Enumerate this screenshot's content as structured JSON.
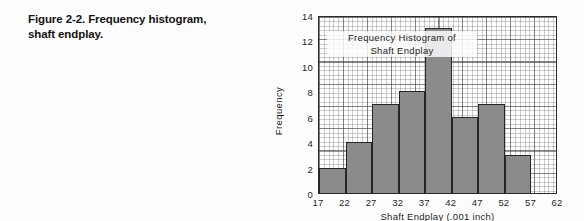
{
  "caption": {
    "line1": "Figure 2-2. Frequency histogram,",
    "line2": "shaft endplay."
  },
  "chart_data": {
    "type": "bar",
    "title": "Frequency Histogram of Shaft Endplay",
    "title_line1": "Frequency Histogram of",
    "title_line2": "Shaft Endplay",
    "xlabel": "Shaft Endplay (.001 inch)",
    "ylabel": "Frequency",
    "categories": [
      "17-22",
      "22-27",
      "27-32",
      "32-37",
      "37-42",
      "42-47",
      "47-52",
      "52-57"
    ],
    "bin_edges": [
      17,
      22,
      27,
      32,
      37,
      42,
      47,
      52,
      57
    ],
    "values": [
      2,
      4,
      7,
      8,
      13,
      6,
      7,
      3
    ],
    "xticks": [
      17,
      22,
      27,
      32,
      37,
      42,
      47,
      52,
      57,
      62
    ],
    "xticklabels": [
      "17",
      "22",
      "27",
      "32",
      "37",
      "42",
      "47",
      "52",
      "57",
      "62"
    ],
    "yticks": [
      0,
      2,
      4,
      6,
      8,
      10,
      12,
      14
    ],
    "yticklabels": [
      "0",
      "2",
      "4",
      "6",
      "8",
      "10",
      "12",
      "14"
    ],
    "xlim": [
      17,
      62
    ],
    "ylim": [
      0,
      14
    ],
    "grid": true,
    "legend": false,
    "bar_fill_color": "#8b8b8b",
    "bar_edge_color": "#262626",
    "axis_color": "#2a2a2a",
    "grid_color": "#787878",
    "background_color": "#fdfdfd",
    "plot_background_color": "#ffffff"
  }
}
